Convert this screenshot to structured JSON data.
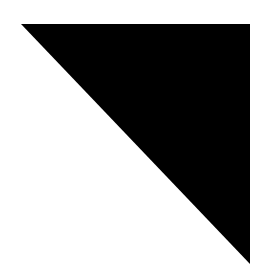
{
  "canvas": {
    "width": 264,
    "height": 278,
    "background": "#ffffff"
  },
  "shape": {
    "type": "right-triangle",
    "fill": "#000000",
    "points": [
      [
        21,
        24
      ],
      [
        250,
        24
      ],
      [
        250,
        264
      ]
    ]
  }
}
